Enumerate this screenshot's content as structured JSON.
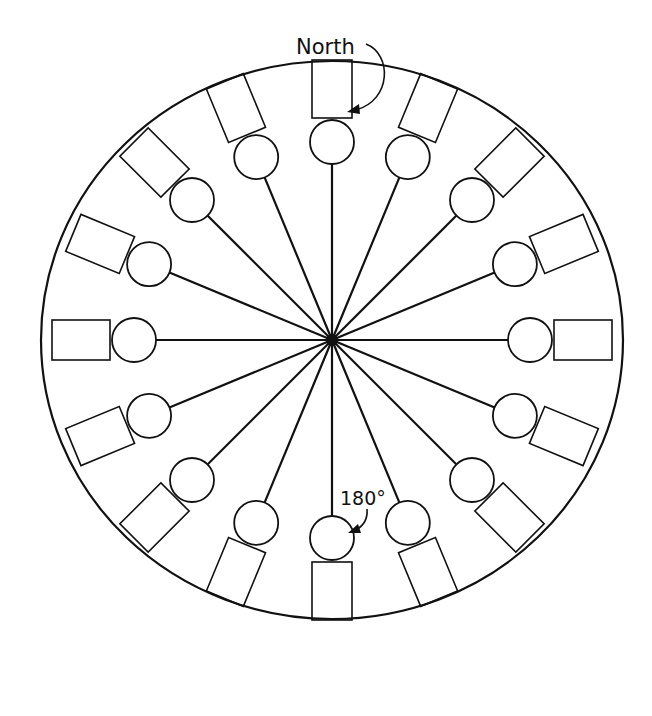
{
  "diagram": {
    "type": "radial-layout",
    "labels": {
      "north": "North",
      "south_angle": "180°"
    },
    "spoke_count": 16,
    "elements_per_spoke": [
      "circle",
      "rectangle"
    ],
    "colors": {
      "stroke": "#111111",
      "background": "#ffffff"
    }
  }
}
